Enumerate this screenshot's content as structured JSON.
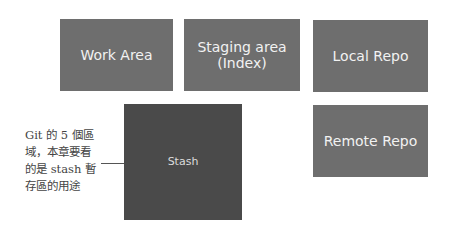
{
  "diagram": {
    "boxes": {
      "work_area": {
        "label": "Work Area"
      },
      "staging_area": {
        "line1": "Staging area",
        "line2": "(Index)"
      },
      "local_repo": {
        "label": "Local Repo"
      },
      "remote_repo": {
        "label": "Remote Repo"
      },
      "stash": {
        "label": "Stash"
      }
    },
    "annotation": {
      "lines": [
        "Git 的 5 個區",
        "域，本章要看",
        "的是 stash 暫",
        "存區的用途"
      ]
    },
    "colors": {
      "box": "#6e6e6e",
      "stash_box": "#4a4a4a",
      "text_light": "#f2f2f2",
      "annotation_text": "#444444"
    }
  }
}
